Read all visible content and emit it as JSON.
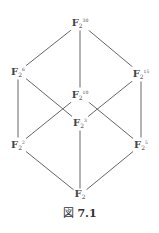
{
  "diagram": {
    "type": "subfield-lattice",
    "nodes": [
      {
        "id": "n30",
        "base": "F",
        "sub": "2",
        "exp": "30",
        "x": 80,
        "y": 23
      },
      {
        "id": "n6",
        "base": "F",
        "sub": "2",
        "exp": "6",
        "x": 18,
        "y": 72
      },
      {
        "id": "n15",
        "base": "F",
        "sub": "2",
        "exp": "15",
        "x": 141,
        "y": 74
      },
      {
        "id": "n10",
        "base": "F",
        "sub": "2",
        "exp": "10",
        "x": 80,
        "y": 95
      },
      {
        "id": "n3",
        "base": "F",
        "sub": "2",
        "exp": "3",
        "x": 80,
        "y": 123
      },
      {
        "id": "n2",
        "base": "F",
        "sub": "2",
        "exp": "2",
        "x": 18,
        "y": 145
      },
      {
        "id": "n5",
        "base": "F",
        "sub": "2",
        "exp": "5",
        "x": 141,
        "y": 145
      },
      {
        "id": "n1",
        "base": "F",
        "sub": "2",
        "exp": "",
        "x": 80,
        "y": 195
      }
    ],
    "edges": [
      [
        "n30",
        "n6"
      ],
      [
        "n30",
        "n10"
      ],
      [
        "n30",
        "n15"
      ],
      [
        "n6",
        "n2"
      ],
      [
        "n6",
        "n3"
      ],
      [
        "n15",
        "n3"
      ],
      [
        "n15",
        "n5"
      ],
      [
        "n10",
        "n2"
      ],
      [
        "n10",
        "n5"
      ],
      [
        "n2",
        "n1"
      ],
      [
        "n3",
        "n1"
      ],
      [
        "n5",
        "n1"
      ]
    ],
    "labels": {
      "n30": {
        "base": "F",
        "sub": "2",
        "exp": "30"
      },
      "n6": {
        "base": "F",
        "sub": "2",
        "exp": "6"
      },
      "n15": {
        "base": "F",
        "sub": "2",
        "exp": "15"
      },
      "n10": {
        "base": "F",
        "sub": "2",
        "exp": "10"
      },
      "n3": {
        "base": "F",
        "sub": "2",
        "exp": "3"
      },
      "n2": {
        "base": "F",
        "sub": "2",
        "exp": "2"
      },
      "n5": {
        "base": "F",
        "sub": "2",
        "exp": "5"
      },
      "n1": {
        "base": "F",
        "sub": "2",
        "exp": ""
      }
    }
  },
  "caption": {
    "prefix": "図",
    "number": "7.1"
  }
}
